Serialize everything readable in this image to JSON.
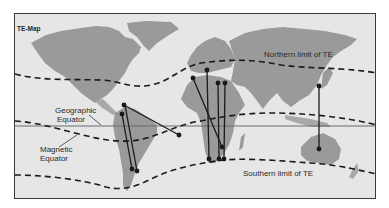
{
  "map": {
    "title": "TE-Map",
    "labels": {
      "northern_limit": "Northern limit of TE",
      "southern_limit": "Southern limit of TE",
      "geographic_equator_line1": "Geographic",
      "geographic_equator_line2": "Equator",
      "magnetic_equator_line1": "Magnetic",
      "magnetic_equator_line2": "Equator"
    },
    "colors": {
      "ocean": "#e6e6e6",
      "land": "#9a9a9a",
      "lines": "#1a1a1a",
      "equator": "#6a6a6a",
      "frame": "#3a3a3a"
    },
    "propagation_paths": [
      {
        "name": "caribbean-to-south-atlantic",
        "from": [
          108,
          115
        ],
        "to": [
          177,
          133
        ]
      },
      {
        "name": "colombia-to-argentina-1",
        "from": [
          119,
          112
        ],
        "to": [
          131,
          167
        ]
      },
      {
        "name": "venezuela-to-argentina-2",
        "from": [
          123,
          104
        ],
        "to": [
          135,
          169
        ]
      },
      {
        "name": "morocco-to-southern-africa",
        "from": [
          192,
          77
        ],
        "to": [
          220,
          145
        ]
      },
      {
        "name": "italy-to-south-africa",
        "from": [
          206,
          68
        ],
        "to": [
          208,
          157
        ]
      },
      {
        "name": "greece-to-south-africa",
        "from": [
          216,
          81
        ],
        "to": [
          218,
          157
        ]
      },
      {
        "name": "cyprus-to-south-africa",
        "from": [
          224,
          81
        ],
        "to": [
          223,
          157
        ]
      },
      {
        "name": "japan-to-australia",
        "from": [
          318,
          85
        ],
        "to": [
          319,
          148
        ]
      }
    ]
  }
}
